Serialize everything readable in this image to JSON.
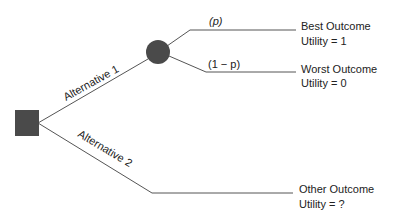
{
  "diagram": {
    "type": "decision-tree",
    "decision_node": {
      "shape": "square",
      "color": "#4a4a4a"
    },
    "chance_node": {
      "shape": "circle",
      "color": "#4a4a4a"
    },
    "line_color": "#555555",
    "branches": {
      "alt1": "Alternative 1",
      "alt2": "Alternative 2"
    },
    "probabilities": {
      "p": "(p)",
      "one_minus_p": "(1 − p)"
    },
    "outcomes": [
      {
        "name": "Best Outcome",
        "utility": "Utility = 1"
      },
      {
        "name": "Worst Outcome",
        "utility": "Utility = 0"
      },
      {
        "name": "Other Outcome",
        "utility": "Utility = ?"
      }
    ]
  }
}
